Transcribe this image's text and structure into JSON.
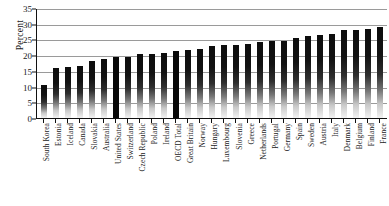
{
  "chart_data": {
    "type": "bar",
    "title": "",
    "xlabel": "",
    "ylabel": "Percent",
    "ylim": [
      0,
      35
    ],
    "yticks": [
      0,
      5,
      10,
      15,
      20,
      25,
      30,
      35
    ],
    "grid": true,
    "legend": "none",
    "categories": [
      "South Korea",
      "Estonia",
      "Iceland",
      "Canada",
      "Slovakia",
      "Australia",
      "United States",
      "Switzerland",
      "Czech Republic",
      "Poland",
      "Ireland",
      "OECD Total",
      "Great Britain",
      "Norway",
      "Hungary",
      "Luxembourg",
      "Slovenia",
      "Greece",
      "Netherlands",
      "Portugal",
      "Germany",
      "Spain",
      "Sweden",
      "Austria",
      "Italy",
      "Denmark",
      "Belgium",
      "Finland",
      "France"
    ],
    "values": [
      10.5,
      15.9,
      16.1,
      16.6,
      18.1,
      18.9,
      19.5,
      19.4,
      20.5,
      20.5,
      20.8,
      21.4,
      21.8,
      22.0,
      23.0,
      23.1,
      23.3,
      23.5,
      24.3,
      24.4,
      24.5,
      25.5,
      26.0,
      26.4,
      26.8,
      28.0,
      28.1,
      28.3,
      29.0
    ],
    "highlighted": [
      "United States",
      "OECD Total"
    ],
    "highlight_color": "#080808",
    "bar_color": "#1a1a1a",
    "grid_color": "#9a9a9a",
    "axis_color": "#111111"
  },
  "caption": ""
}
